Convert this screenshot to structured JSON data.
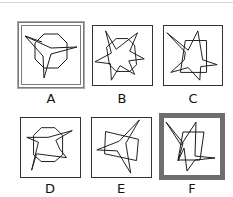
{
  "puzzle": {
    "options": [
      {
        "label": "A",
        "state": "highlighted-double-border",
        "figure": "octagon with three-pronged star overlay"
      },
      {
        "label": "B",
        "state": "normal",
        "figure": "octagon with six-pointed irregular star"
      },
      {
        "label": "C",
        "state": "normal",
        "figure": "rectangle with irregular star"
      },
      {
        "label": "D",
        "state": "normal",
        "figure": "octagon with irregular star"
      },
      {
        "label": "E",
        "state": "normal",
        "figure": "tilted rectangle with four-pointed star"
      },
      {
        "label": "F",
        "state": "selected-thick-border",
        "figure": "rectangle with irregular star"
      }
    ],
    "colors": {
      "line": "#1a1a1a",
      "frame": "#333333",
      "highlight_border": "#6e6e6e",
      "background": "#ffffff"
    }
  }
}
